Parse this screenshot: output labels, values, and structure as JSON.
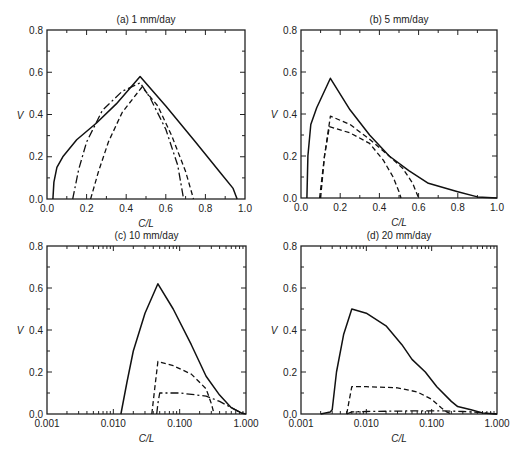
{
  "figure": {
    "ylabel": "V",
    "xlabel": "C/L"
  },
  "chart_data": [
    {
      "id": "a",
      "type": "line",
      "title": "(a) 1 mm/day",
      "xlabel": "C/L",
      "ylabel": "V",
      "xscale": "linear",
      "xlim": [
        0.0,
        1.0
      ],
      "ylim": [
        0.0,
        0.8
      ],
      "xticks": [
        "0.0",
        "0.2",
        "0.4",
        "0.6",
        "0.8",
        "1.0"
      ],
      "yticks": [
        "0.0",
        "0.2",
        "0.4",
        "0.6",
        "0.8"
      ],
      "series": [
        {
          "name": "solid",
          "style": "solid",
          "points": [
            [
              0.03,
              0
            ],
            [
              0.035,
              0.08
            ],
            [
              0.05,
              0.15
            ],
            [
              0.08,
              0.2
            ],
            [
              0.15,
              0.28
            ],
            [
              0.25,
              0.36
            ],
            [
              0.35,
              0.45
            ],
            [
              0.47,
              0.58
            ],
            [
              0.6,
              0.44
            ],
            [
              0.75,
              0.27
            ],
            [
              0.88,
              0.12
            ],
            [
              0.94,
              0.05
            ],
            [
              0.96,
              0
            ]
          ]
        },
        {
          "name": "dash-dot",
          "style": "dashdot",
          "points": [
            [
              0.13,
              0
            ],
            [
              0.16,
              0.14
            ],
            [
              0.2,
              0.27
            ],
            [
              0.28,
              0.42
            ],
            [
              0.38,
              0.51
            ],
            [
              0.47,
              0.55
            ],
            [
              0.52,
              0.48
            ],
            [
              0.6,
              0.33
            ],
            [
              0.66,
              0.16
            ],
            [
              0.69,
              0
            ]
          ]
        },
        {
          "name": "dashed",
          "style": "dashed",
          "points": [
            [
              0.22,
              0
            ],
            [
              0.26,
              0.13
            ],
            [
              0.31,
              0.27
            ],
            [
              0.38,
              0.41
            ],
            [
              0.48,
              0.53
            ],
            [
              0.56,
              0.44
            ],
            [
              0.63,
              0.3
            ],
            [
              0.7,
              0.13
            ],
            [
              0.74,
              0
            ]
          ]
        }
      ]
    },
    {
      "id": "b",
      "type": "line",
      "title": "(b) 5 mm/day",
      "xlabel": "C/L",
      "ylabel": "V",
      "xscale": "linear",
      "xlim": [
        0.0,
        1.0
      ],
      "ylim": [
        0.0,
        0.8
      ],
      "xticks": [
        "0.0",
        "0.2",
        "0.4",
        "0.6",
        "0.8",
        "1.0"
      ],
      "yticks": [
        "0.0",
        "0.2",
        "0.4",
        "0.6",
        "0.8"
      ],
      "series": [
        {
          "name": "solid",
          "style": "solid",
          "points": [
            [
              0.03,
              0
            ],
            [
              0.035,
              0.2
            ],
            [
              0.05,
              0.35
            ],
            [
              0.08,
              0.43
            ],
            [
              0.15,
              0.57
            ],
            [
              0.25,
              0.42
            ],
            [
              0.35,
              0.3
            ],
            [
              0.45,
              0.2
            ],
            [
              0.55,
              0.13
            ],
            [
              0.65,
              0.07
            ],
            [
              0.8,
              0.03
            ],
            [
              0.9,
              0.005
            ],
            [
              1.0,
              0
            ]
          ]
        },
        {
          "name": "dashed-upper",
          "style": "dashed",
          "points": [
            [
              0.1,
              0
            ],
            [
              0.12,
              0.2
            ],
            [
              0.15,
              0.39
            ],
            [
              0.25,
              0.35
            ],
            [
              0.35,
              0.28
            ],
            [
              0.45,
              0.2
            ],
            [
              0.52,
              0.14
            ],
            [
              0.57,
              0.07
            ],
            [
              0.6,
              0
            ]
          ]
        },
        {
          "name": "dashed-lower",
          "style": "dashed",
          "points": [
            [
              0.095,
              0
            ],
            [
              0.12,
              0.2
            ],
            [
              0.145,
              0.34
            ],
            [
              0.25,
              0.31
            ],
            [
              0.35,
              0.26
            ],
            [
              0.42,
              0.18
            ],
            [
              0.47,
              0.1
            ],
            [
              0.5,
              0.03
            ],
            [
              0.51,
              0
            ]
          ]
        }
      ]
    },
    {
      "id": "c",
      "type": "line",
      "title": "(c) 10 mm/day",
      "xlabel": "C/L",
      "ylabel": "V",
      "xscale": "log",
      "xlim": [
        0.001,
        1.0
      ],
      "ylim": [
        0.0,
        0.8
      ],
      "xticks": [
        "0.001",
        "0.010",
        "0.100",
        "1.000"
      ],
      "yticks": [
        "0.0",
        "0.2",
        "0.4",
        "0.6",
        "0.8"
      ],
      "series": [
        {
          "name": "solid",
          "style": "solid",
          "points": [
            [
              0.013,
              0
            ],
            [
              0.016,
              0.15
            ],
            [
              0.02,
              0.3
            ],
            [
              0.03,
              0.48
            ],
            [
              0.047,
              0.62
            ],
            [
              0.08,
              0.5
            ],
            [
              0.15,
              0.33
            ],
            [
              0.25,
              0.18
            ],
            [
              0.4,
              0.09
            ],
            [
              0.6,
              0.03
            ],
            [
              0.85,
              0.005
            ],
            [
              1.0,
              0
            ]
          ]
        },
        {
          "name": "dashed",
          "style": "dashed",
          "points": [
            [
              0.038,
              0
            ],
            [
              0.042,
              0.12
            ],
            [
              0.047,
              0.25
            ],
            [
              0.08,
              0.23
            ],
            [
              0.15,
              0.19
            ],
            [
              0.25,
              0.12
            ],
            [
              0.3,
              0.05
            ],
            [
              0.33,
              0
            ]
          ]
        },
        {
          "name": "dash-dot",
          "style": "dashdot",
          "points": [
            [
              0.045,
              0
            ],
            [
              0.047,
              0.05
            ],
            [
              0.05,
              0.1
            ],
            [
              0.1,
              0.1
            ],
            [
              0.25,
              0.085
            ],
            [
              0.4,
              0.06
            ],
            [
              0.6,
              0.03
            ],
            [
              0.85,
              0.005
            ],
            [
              1.0,
              0
            ]
          ]
        }
      ]
    },
    {
      "id": "d",
      "type": "line",
      "title": "(d) 20 mm/day",
      "xlabel": "C/L",
      "ylabel": "V",
      "xscale": "log",
      "xlim": [
        0.001,
        1.0
      ],
      "ylim": [
        0.0,
        0.8
      ],
      "xticks": [
        "0.001",
        "0.010",
        "0.100",
        "1.000"
      ],
      "yticks": [
        "0.0",
        "0.2",
        "0.4",
        "0.6",
        "0.8"
      ],
      "series": [
        {
          "name": "solid",
          "style": "solid",
          "points": [
            [
              0.002,
              0
            ],
            [
              0.0028,
              0.01
            ],
            [
              0.003,
              0.02
            ],
            [
              0.0035,
              0.2
            ],
            [
              0.0045,
              0.38
            ],
            [
              0.006,
              0.5
            ],
            [
              0.01,
              0.48
            ],
            [
              0.02,
              0.42
            ],
            [
              0.035,
              0.33
            ],
            [
              0.05,
              0.26
            ],
            [
              0.08,
              0.2
            ],
            [
              0.12,
              0.13
            ],
            [
              0.2,
              0.06
            ],
            [
              0.25,
              0.035
            ],
            [
              0.4,
              0.02
            ],
            [
              0.6,
              0.005
            ],
            [
              1.0,
              0
            ]
          ]
        },
        {
          "name": "dashed",
          "style": "dashed",
          "points": [
            [
              0.005,
              0
            ],
            [
              0.0055,
              0.07
            ],
            [
              0.006,
              0.13
            ],
            [
              0.01,
              0.13
            ],
            [
              0.03,
              0.125
            ],
            [
              0.06,
              0.105
            ],
            [
              0.1,
              0.07
            ],
            [
              0.14,
              0.03
            ],
            [
              0.17,
              0.01
            ],
            [
              0.2,
              0
            ]
          ]
        },
        {
          "name": "dash-dot",
          "style": "dashdot",
          "points": [
            [
              0.005,
              0
            ],
            [
              0.006,
              0.01
            ],
            [
              0.01,
              0.012
            ],
            [
              0.05,
              0.015
            ],
            [
              0.15,
              0.015
            ],
            [
              0.3,
              0.012
            ],
            [
              0.5,
              0.008
            ],
            [
              1.0,
              0
            ]
          ]
        }
      ]
    }
  ]
}
